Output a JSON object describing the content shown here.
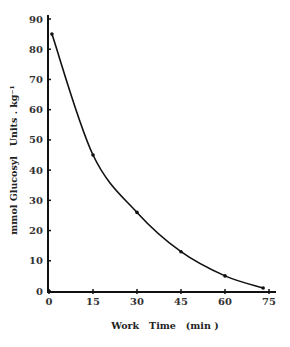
{
  "chart_data": {
    "type": "line",
    "title": "",
    "xlabel": "Work   Time   (min )",
    "ylabel": "mmol Glucosyl   Units . kg⁻¹",
    "x": [
      1,
      15,
      30,
      45,
      60,
      73
    ],
    "series": [
      {
        "name": "Glycogen",
        "values": [
          85,
          45,
          26,
          13,
          5,
          1
        ]
      }
    ],
    "xlim": [
      0,
      75
    ],
    "ylim": [
      0,
      90
    ],
    "xticks": [
      0,
      15,
      30,
      45,
      60,
      75
    ],
    "yticks": [
      0,
      10,
      20,
      30,
      40,
      50,
      60,
      70,
      80,
      90
    ],
    "grid": false,
    "legend": "none",
    "colors": {
      "line": "#111111",
      "axis": "#111111",
      "text": "#333333"
    }
  }
}
